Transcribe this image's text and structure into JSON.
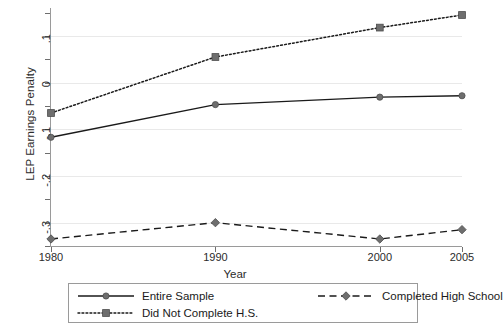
{
  "chart_data": {
    "type": "line",
    "title": "",
    "xlabel": "Year",
    "ylabel": "LEP Earnings Penalty",
    "x": [
      1980,
      1990,
      2000,
      2005
    ],
    "xtick_labels": [
      "1980",
      "1990",
      "2000",
      "2005"
    ],
    "ytick_labels": [
      ".1",
      "0",
      "-.1",
      "-.2",
      "-.3"
    ],
    "ytick_values": [
      0.1,
      0,
      -0.1,
      -0.2,
      -0.3
    ],
    "xlim": [
      1980,
      2005
    ],
    "ylim": [
      -0.35,
      0.16
    ],
    "grid": "horizontal",
    "legend_position": "below-center",
    "series": [
      {
        "name": "Entire Sample",
        "style": "solid",
        "marker": "circle",
        "values": [
          -0.117,
          -0.047,
          -0.031,
          -0.028
        ]
      },
      {
        "name": "Completed High School",
        "style": "dashed",
        "marker": "diamond",
        "values": [
          -0.335,
          -0.3,
          -0.335,
          -0.315
        ]
      },
      {
        "name": "Did Not Complete H.S.",
        "style": "dotted",
        "marker": "square",
        "values": [
          -0.065,
          0.055,
          0.118,
          0.145
        ]
      }
    ]
  },
  "colors": {
    "line": "#1a1a1a",
    "marker": "#6e6e6e",
    "grid": "#e8e8e8",
    "axis": "#9a9a9a",
    "text": "#2b2b2b",
    "legend_border": "#9a9a9a",
    "background": "#ffffff"
  },
  "legend": {
    "entries": [
      {
        "label": "Entire Sample"
      },
      {
        "label": "Completed High School"
      },
      {
        "label": "Did Not Complete H.S."
      }
    ]
  },
  "axes": {
    "x_title": "Year",
    "y_title": "LEP Earnings Penalty"
  }
}
